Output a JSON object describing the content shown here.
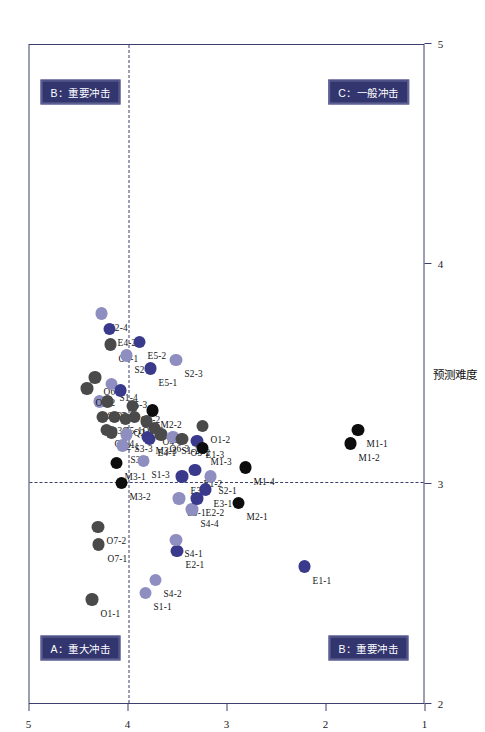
{
  "chart_data": {
    "type": "scatter",
    "title": "",
    "xlabel": "预测难度",
    "ylabel": "潜在影响",
    "xlim": [
      2,
      5
    ],
    "ylim": [
      1,
      5
    ],
    "xticks": [
      2,
      3,
      4,
      5
    ],
    "yticks": [
      1,
      2,
      3,
      4,
      5
    ],
    "grid": false,
    "legend": false,
    "reference_lines": {
      "vertical_x": 3.0,
      "horizontal_y": 4.0
    },
    "quadrants": [
      {
        "id": "A",
        "label": "A：重大冲击",
        "position": "top-left"
      },
      {
        "id": "B-top",
        "label": "B：重要冲击",
        "position": "top-right"
      },
      {
        "id": "B-bottom",
        "label": "B：重要冲击",
        "position": "bottom-left"
      },
      {
        "id": "C",
        "label": "C：一般冲击",
        "position": "bottom-right"
      }
    ],
    "colors": {
      "dark_gray": "#4a4a4a",
      "light_purple": "#8e8fc0",
      "deep_purple": "#3a3a8c",
      "black": "#0d0d0d",
      "frame": "#3b3f6b",
      "badge_bg": "#32356e"
    },
    "points": [
      {
        "label": "O1-1",
        "x": 2.47,
        "y": 4.37,
        "color": "dark_gray"
      },
      {
        "label": "O7-1",
        "x": 2.72,
        "y": 4.3,
        "color": "dark_gray"
      },
      {
        "label": "O7-2",
        "x": 2.8,
        "y": 4.31,
        "color": "dark_gray"
      },
      {
        "label": "S1-1",
        "x": 2.5,
        "y": 3.83,
        "color": "light_purple"
      },
      {
        "label": "S4-2",
        "x": 2.56,
        "y": 3.73,
        "color": "light_purple"
      },
      {
        "label": "M3-2",
        "x": 3.0,
        "y": 4.07,
        "color": "black"
      },
      {
        "label": "M3-1",
        "x": 3.09,
        "y": 4.12,
        "color": "black"
      },
      {
        "label": "O2-4",
        "x": 3.24,
        "y": 4.22,
        "color": "dark_gray"
      },
      {
        "label": "O3-1",
        "x": 3.3,
        "y": 4.26,
        "color": "dark_gray"
      },
      {
        "label": "S4-3",
        "x": 3.37,
        "y": 4.29,
        "color": "light_purple"
      },
      {
        "label": "O3-2",
        "x": 3.43,
        "y": 4.42,
        "color": "dark_gray"
      },
      {
        "label": "O6-2",
        "x": 3.48,
        "y": 4.34,
        "color": "dark_gray"
      },
      {
        "label": "O2-2",
        "x": 3.37,
        "y": 4.21,
        "color": "dark_gray"
      },
      {
        "label": "O2-1",
        "x": 3.23,
        "y": 4.17,
        "color": "dark_gray"
      },
      {
        "label": "O5-1",
        "x": 3.3,
        "y": 4.14,
        "color": "dark_gray"
      },
      {
        "label": "S1-4",
        "x": 3.45,
        "y": 4.17,
        "color": "light_purple"
      },
      {
        "label": "S3-2",
        "x": 3.17,
        "y": 4.06,
        "color": "light_purple"
      },
      {
        "label": "S3-3",
        "x": 3.22,
        "y": 4.02,
        "color": "light_purple"
      },
      {
        "label": "Q2-3",
        "x": 3.29,
        "y": 4.03,
        "color": "dark_gray"
      },
      {
        "label": "E5-3",
        "x": 3.42,
        "y": 4.08,
        "color": "deep_purple"
      },
      {
        "label": "O6-1",
        "x": 3.63,
        "y": 4.18,
        "color": "dark_gray"
      },
      {
        "label": "S2-4",
        "x": 3.77,
        "y": 4.27,
        "color": "light_purple"
      },
      {
        "label": "E4-2",
        "x": 3.7,
        "y": 4.19,
        "color": "deep_purple"
      },
      {
        "label": "S2-2",
        "x": 3.58,
        "y": 4.02,
        "color": "light_purple"
      },
      {
        "label": "O4-2",
        "x": 3.35,
        "y": 3.96,
        "color": "dark_gray"
      },
      {
        "label": "O4-3",
        "x": 3.3,
        "y": 3.94,
        "color": "dark_gray"
      },
      {
        "label": "E5-2",
        "x": 3.64,
        "y": 3.89,
        "color": "deep_purple"
      },
      {
        "label": "S1-3",
        "x": 3.1,
        "y": 3.85,
        "color": "light_purple"
      },
      {
        "label": "M3-3",
        "x": 3.21,
        "y": 3.81,
        "color": "deep_purple"
      },
      {
        "label": "O1-3",
        "x": 3.28,
        "y": 3.82,
        "color": "dark_gray"
      },
      {
        "label": "E4-1",
        "x": 3.2,
        "y": 3.79,
        "color": "deep_purple"
      },
      {
        "label": "O4-1",
        "x": 3.25,
        "y": 3.74,
        "color": "dark_gray"
      },
      {
        "label": "M2-2",
        "x": 3.33,
        "y": 3.76,
        "color": "black"
      },
      {
        "label": "O6-3",
        "x": 3.22,
        "y": 3.67,
        "color": "dark_gray"
      },
      {
        "label": "E5-1",
        "x": 3.52,
        "y": 3.78,
        "color": "deep_purple"
      },
      {
        "label": "S1-2",
        "x": 3.21,
        "y": 3.55,
        "color": "light_purple"
      },
      {
        "label": "S2-3",
        "x": 3.56,
        "y": 3.52,
        "color": "light_purple"
      },
      {
        "label": "E2-1",
        "x": 2.69,
        "y": 3.51,
        "color": "deep_purple"
      },
      {
        "label": "S4-1",
        "x": 2.74,
        "y": 3.52,
        "color": "light_purple"
      },
      {
        "label": "S3-1",
        "x": 2.93,
        "y": 3.49,
        "color": "light_purple"
      },
      {
        "label": "E3-2",
        "x": 3.03,
        "y": 3.46,
        "color": "deep_purple"
      },
      {
        "label": "O5-2",
        "x": 3.2,
        "y": 3.46,
        "color": "dark_gray"
      },
      {
        "label": "S4-4",
        "x": 2.88,
        "y": 3.36,
        "color": "light_purple"
      },
      {
        "label": "E2-2",
        "x": 2.93,
        "y": 3.31,
        "color": "deep_purple"
      },
      {
        "label": "E1-2",
        "x": 3.06,
        "y": 3.33,
        "color": "deep_purple"
      },
      {
        "label": "E1-3",
        "x": 3.19,
        "y": 3.31,
        "color": "deep_purple"
      },
      {
        "label": "M1-3",
        "x": 3.16,
        "y": 3.25,
        "color": "black"
      },
      {
        "label": "O1-2",
        "x": 3.26,
        "y": 3.25,
        "color": "dark_gray"
      },
      {
        "label": "E3-1",
        "x": 2.97,
        "y": 3.22,
        "color": "deep_purple"
      },
      {
        "label": "S2-1",
        "x": 3.03,
        "y": 3.17,
        "color": "light_purple"
      },
      {
        "label": "M2-1",
        "x": 2.91,
        "y": 2.89,
        "color": "black"
      },
      {
        "label": "M1-4",
        "x": 3.07,
        "y": 2.82,
        "color": "black"
      },
      {
        "label": "E1-1",
        "x": 2.62,
        "y": 2.22,
        "color": "deep_purple"
      },
      {
        "label": "M1-2",
        "x": 3.18,
        "y": 1.76,
        "color": "black"
      },
      {
        "label": "M1-1",
        "x": 3.24,
        "y": 1.68,
        "color": "black"
      }
    ]
  }
}
